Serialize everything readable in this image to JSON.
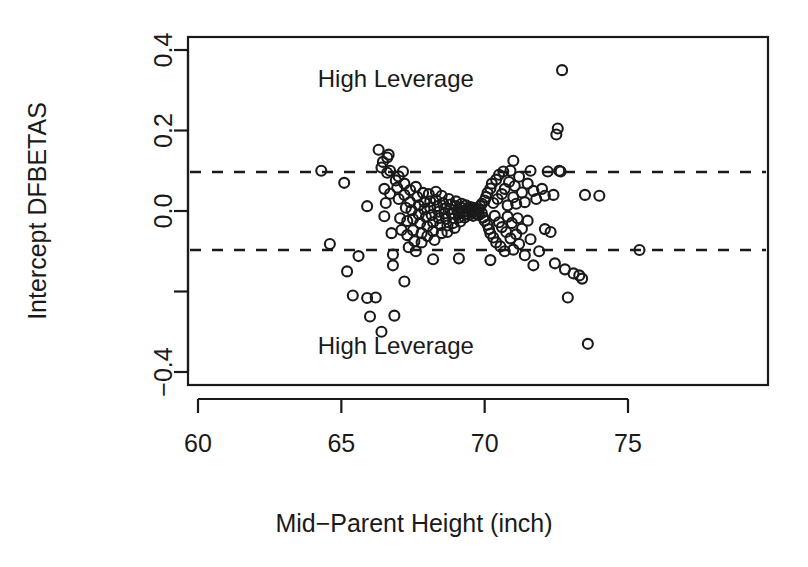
{
  "chart_data": {
    "type": "scatter",
    "title": "",
    "xlabel": "Mid−Parent Height (inch)",
    "ylabel": "Intercept DFBETAS",
    "xlim": [
      58.5,
      78.7
    ],
    "ylim": [
      -0.455,
      0.455
    ],
    "xticks": [
      60,
      65,
      70,
      75
    ],
    "xtick_labels": [
      "60",
      "65",
      "70",
      "75"
    ],
    "yticks": [
      -0.4,
      -0.2,
      0.0,
      0.2,
      0.4
    ],
    "ytick_labels": [
      "-0.4",
      "",
      "0.0",
      "0.2",
      "0.4"
    ],
    "ytick_labels_shown": [
      "−0.4",
      "0.0",
      "0.2",
      "0.4"
    ],
    "grid": false,
    "legend": "none",
    "marker": "open-circle",
    "marker_color": "#1a1a1a",
    "marker_radius_px": 5,
    "reference_lines": [
      {
        "name": "upper-leverage-threshold",
        "y": 0.097,
        "style": "dashed"
      },
      {
        "name": "lower-leverage-threshold",
        "y": -0.097,
        "style": "dashed"
      }
    ],
    "annotations": [
      {
        "text": "High Leverage",
        "x": 66.9,
        "y": 0.33
      },
      {
        "text": "High Leverage",
        "x": 66.9,
        "y": -0.335
      }
    ],
    "points": [
      [
        64.3,
        0.1
      ],
      [
        64.6,
        -0.082
      ],
      [
        65.1,
        0.07
      ],
      [
        65.2,
        -0.15
      ],
      [
        65.4,
        -0.21
      ],
      [
        65.6,
        -0.112
      ],
      [
        65.9,
        -0.216
      ],
      [
        66.0,
        -0.262
      ],
      [
        66.2,
        -0.215
      ],
      [
        66.3,
        0.152
      ],
      [
        66.4,
        0.108
      ],
      [
        66.45,
        0.122
      ],
      [
        66.5,
        0.055
      ],
      [
        66.5,
        -0.013
      ],
      [
        66.55,
        0.02
      ],
      [
        66.6,
        0.095
      ],
      [
        66.6,
        0.133
      ],
      [
        66.65,
        0.14
      ],
      [
        66.7,
        0.1
      ],
      [
        66.7,
        0.043
      ],
      [
        66.75,
        -0.055
      ],
      [
        66.8,
        -0.108
      ],
      [
        66.8,
        -0.135
      ],
      [
        66.85,
        -0.26
      ],
      [
        66.9,
        0.076
      ],
      [
        66.95,
        0.058
      ],
      [
        67.0,
        0.086
      ],
      [
        67.0,
        0.03
      ],
      [
        67.05,
        -0.018
      ],
      [
        67.1,
        -0.047
      ],
      [
        67.15,
        0.098
      ],
      [
        67.2,
        0.068
      ],
      [
        67.2,
        0.04
      ],
      [
        67.25,
        0.008
      ],
      [
        67.3,
        -0.025
      ],
      [
        67.3,
        -0.06
      ],
      [
        67.35,
        -0.09
      ],
      [
        67.4,
        0.052
      ],
      [
        67.4,
        0.022
      ],
      [
        67.45,
        0.002
      ],
      [
        67.5,
        -0.02
      ],
      [
        67.5,
        -0.048
      ],
      [
        67.55,
        -0.075
      ],
      [
        67.6,
        -0.1
      ],
      [
        67.6,
        0.06
      ],
      [
        67.65,
        0.035
      ],
      [
        67.7,
        0.014
      ],
      [
        67.7,
        -0.008
      ],
      [
        67.75,
        -0.03
      ],
      [
        67.8,
        -0.055
      ],
      [
        67.8,
        -0.078
      ],
      [
        67.85,
        0.045
      ],
      [
        67.9,
        0.022
      ],
      [
        67.9,
        0.004
      ],
      [
        67.95,
        -0.015
      ],
      [
        68.0,
        -0.038
      ],
      [
        68.0,
        -0.062
      ],
      [
        68.05,
        0.042
      ],
      [
        68.1,
        0.024
      ],
      [
        68.1,
        0.008
      ],
      [
        68.15,
        -0.01
      ],
      [
        68.2,
        -0.028
      ],
      [
        68.2,
        -0.05
      ],
      [
        68.25,
        -0.072
      ],
      [
        68.3,
        0.048
      ],
      [
        68.3,
        0.028
      ],
      [
        68.35,
        0.012
      ],
      [
        68.4,
        -0.002
      ],
      [
        68.4,
        -0.018
      ],
      [
        68.45,
        -0.035
      ],
      [
        68.5,
        -0.055
      ],
      [
        68.5,
        0.038
      ],
      [
        68.55,
        0.02
      ],
      [
        68.6,
        0.006
      ],
      [
        68.6,
        -0.006
      ],
      [
        68.65,
        -0.02
      ],
      [
        68.7,
        -0.036
      ],
      [
        68.7,
        -0.052
      ],
      [
        68.75,
        0.03
      ],
      [
        68.8,
        0.016
      ],
      [
        68.8,
        0.004
      ],
      [
        68.85,
        -0.006
      ],
      [
        68.9,
        -0.018
      ],
      [
        68.9,
        -0.03
      ],
      [
        68.95,
        -0.042
      ],
      [
        69.0,
        0.024
      ],
      [
        69.0,
        0.012
      ],
      [
        69.05,
        0.002
      ],
      [
        69.1,
        -0.006
      ],
      [
        69.1,
        -0.016
      ],
      [
        69.15,
        -0.026
      ],
      [
        69.2,
        0.018
      ],
      [
        69.2,
        0.008
      ],
      [
        69.25,
        0.0
      ],
      [
        69.3,
        -0.008
      ],
      [
        69.3,
        -0.016
      ],
      [
        69.35,
        0.014
      ],
      [
        69.4,
        0.006
      ],
      [
        69.4,
        -0.002
      ],
      [
        69.45,
        -0.01
      ],
      [
        69.5,
        0.01
      ],
      [
        69.5,
        0.002
      ],
      [
        69.55,
        -0.004
      ],
      [
        69.6,
        -0.012
      ],
      [
        69.6,
        0.008
      ],
      [
        69.65,
        0.0
      ],
      [
        69.7,
        -0.007
      ],
      [
        69.7,
        0.006
      ],
      [
        69.75,
        -0.002
      ],
      [
        69.8,
        0.004
      ],
      [
        69.8,
        -0.01
      ],
      [
        69.85,
        0.012
      ],
      [
        69.9,
        -0.005
      ],
      [
        69.9,
        0.018
      ],
      [
        69.95,
        -0.016
      ],
      [
        70.0,
        0.026
      ],
      [
        70.0,
        -0.024
      ],
      [
        70.05,
        0.035
      ],
      [
        70.1,
        -0.034
      ],
      [
        70.1,
        0.045
      ],
      [
        70.15,
        -0.045
      ],
      [
        70.2,
        0.056
      ],
      [
        70.2,
        -0.056
      ],
      [
        70.25,
        0.068
      ],
      [
        70.3,
        -0.066
      ],
      [
        70.3,
        0.02
      ],
      [
        70.35,
        -0.012
      ],
      [
        70.4,
        0.078
      ],
      [
        70.4,
        -0.078
      ],
      [
        70.45,
        0.03
      ],
      [
        70.5,
        -0.028
      ],
      [
        70.5,
        0.09
      ],
      [
        70.55,
        -0.088
      ],
      [
        70.6,
        0.042
      ],
      [
        70.6,
        -0.04
      ],
      [
        70.65,
        0.098
      ],
      [
        70.7,
        -0.1
      ],
      [
        70.7,
        0.055
      ],
      [
        70.75,
        -0.052
      ],
      [
        70.8,
        0.014
      ],
      [
        70.8,
        -0.014
      ],
      [
        70.85,
        0.072
      ],
      [
        70.9,
        -0.068
      ],
      [
        70.9,
        0.1
      ],
      [
        70.95,
        -0.03
      ],
      [
        71.0,
        0.034
      ],
      [
        71.0,
        -0.096
      ],
      [
        71.05,
        0.062
      ],
      [
        71.1,
        -0.058
      ],
      [
        71.1,
        0.018
      ],
      [
        71.15,
        -0.018
      ],
      [
        71.2,
        0.085
      ],
      [
        71.2,
        -0.082
      ],
      [
        71.3,
        0.046
      ],
      [
        71.3,
        -0.044
      ],
      [
        71.4,
        0.022
      ],
      [
        71.4,
        -0.11
      ],
      [
        71.5,
        0.068
      ],
      [
        71.5,
        -0.024
      ],
      [
        71.6,
        0.1
      ],
      [
        71.6,
        -0.07
      ],
      [
        71.7,
        0.05
      ],
      [
        71.7,
        -0.135
      ],
      [
        71.8,
        0.03
      ],
      [
        71.9,
        -0.1
      ],
      [
        72.0,
        0.055
      ],
      [
        72.1,
        0.038
      ],
      [
        72.1,
        -0.045
      ],
      [
        72.2,
        0.098
      ],
      [
        72.3,
        -0.052
      ],
      [
        72.4,
        0.04
      ],
      [
        72.45,
        -0.13
      ],
      [
        72.5,
        0.19
      ],
      [
        72.55,
        0.205
      ],
      [
        72.6,
        0.1
      ],
      [
        72.65,
        0.098
      ],
      [
        72.7,
        0.35
      ],
      [
        72.8,
        -0.145
      ],
      [
        72.9,
        -0.215
      ],
      [
        73.1,
        -0.155
      ],
      [
        73.3,
        -0.16
      ],
      [
        73.4,
        -0.168
      ],
      [
        73.5,
        0.04
      ],
      [
        73.6,
        -0.33
      ],
      [
        74.0,
        0.038
      ],
      [
        75.4,
        -0.097
      ],
      [
        66.4,
        -0.3
      ],
      [
        68.2,
        -0.12
      ],
      [
        69.1,
        -0.118
      ],
      [
        70.2,
        -0.122
      ],
      [
        67.2,
        -0.175
      ],
      [
        71.0,
        0.125
      ],
      [
        65.9,
        0.012
      ]
    ],
    "point_count": 200
  },
  "axes": {
    "y_label_text": "Intercept DFBETAS",
    "x_label_text": "Mid−Parent Height (inch)"
  }
}
